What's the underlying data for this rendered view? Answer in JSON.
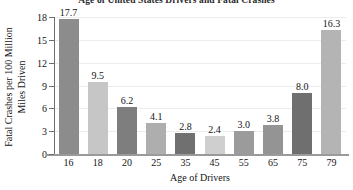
{
  "chart_data": {
    "type": "bar",
    "title": "Age of United States Drivers and Fatal Crashes",
    "xlabel": "Age of Drivers",
    "ylabel_line1": "Fatal Crashes per 100 Million",
    "ylabel_line2": "Miles Driven",
    "categories": [
      "16",
      "18",
      "20",
      "25",
      "35",
      "45",
      "55",
      "65",
      "75",
      "79"
    ],
    "values": [
      17.7,
      9.5,
      6.2,
      4.1,
      2.8,
      2.4,
      3.0,
      3.8,
      8.0,
      16.3
    ],
    "value_labels": [
      "17.7",
      "9.5",
      "6.2",
      "4.1",
      "2.8",
      "2.4",
      "3.0",
      "3.8",
      "8.0",
      "16.3"
    ],
    "bar_colors": [
      "#8c8c8c",
      "#c6c6c6",
      "#7e7e7e",
      "#aeaeae",
      "#707070",
      "#cfcfcf",
      "#9b9b9b",
      "#949494",
      "#6f6f6f",
      "#b4b4b4"
    ],
    "ylim": [
      0,
      18
    ],
    "yticks": [
      0,
      3,
      6,
      9,
      12,
      15,
      18
    ],
    "ytick_labels": [
      "0",
      "3",
      "6",
      "9",
      "12",
      "15",
      "18"
    ],
    "grid": true,
    "grid_color": "#ececec",
    "legend": "none",
    "axis_color": "#6e6e6e",
    "background": "#ffffff"
  }
}
